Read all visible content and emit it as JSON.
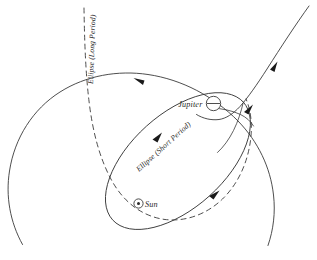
{
  "figure": {
    "background_color": "#ffffff",
    "stroke_color": "#3a3a3a",
    "width": 317,
    "height": 260
  },
  "labels": {
    "long_period": "Ellipse (Long Period)",
    "short_period": "Ellipse (Short Period)",
    "jupiter": "Jupiter",
    "sun": "Sun"
  },
  "markers": {
    "jupiter_symbol": "jupiter-marker-icon",
    "sun_symbol": "sun-marker-icon"
  },
  "paths": {
    "incoming_trajectory": "hyperbolic-approach",
    "long_period_orbit": "large-circle-arc",
    "long_period_dashed": "dashed-long-period-branch",
    "short_period_orbit": "tilted-inner-ellipse"
  },
  "arrows": {
    "incoming_upper": "arrow-on-incoming-trajectory",
    "incoming_lower": "arrow-near-jupiter-encounter",
    "long_period_top": "arrow-on-long-period-top-arc",
    "short_period_upper": "arrow-on-short-period-upper-left",
    "short_period_lower": "arrow-on-short-period-lower-right"
  }
}
